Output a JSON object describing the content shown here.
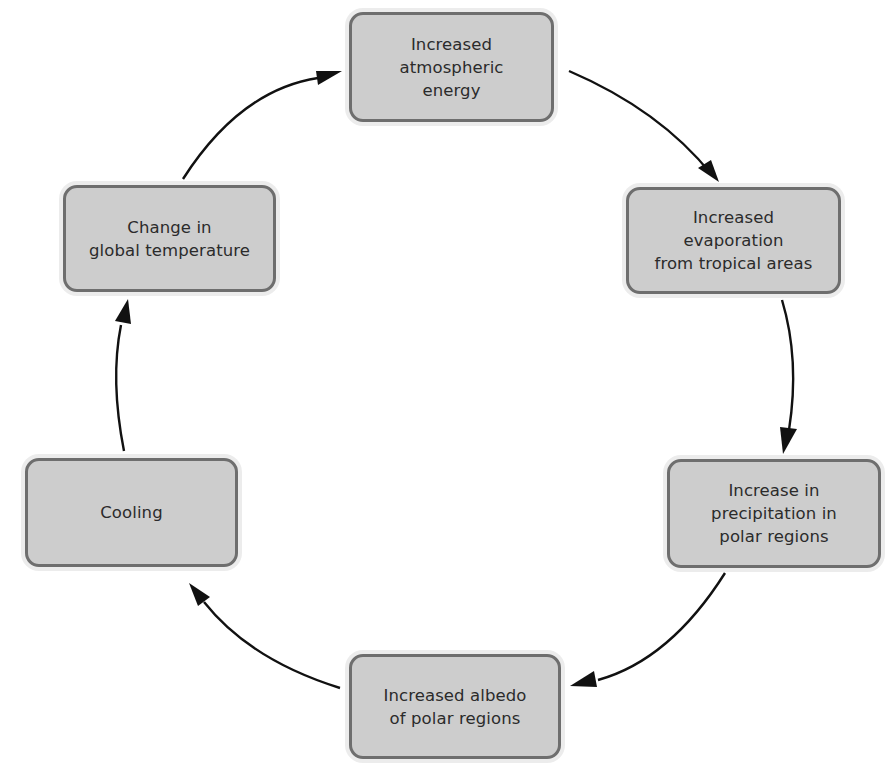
{
  "diagram": {
    "type": "cycle",
    "colors": {
      "box_fill": "#cdcdcd",
      "box_border": "#6e6e6e",
      "text": "#2b2b2b",
      "arrow": "#111111",
      "background": "#ffffff"
    },
    "nodes": [
      {
        "id": "increased-atmospheric-energy",
        "label": "Increased\natmospheric\nenergy"
      },
      {
        "id": "increased-evaporation",
        "label": "Increased\nevaporation\nfrom tropical areas"
      },
      {
        "id": "increase-precipitation",
        "label": "Increase in\nprecipitation in\npolar regions"
      },
      {
        "id": "increased-albedo",
        "label": "Increased albedo\nof polar regions"
      },
      {
        "id": "cooling",
        "label": "Cooling"
      },
      {
        "id": "change-global-temperature",
        "label": "Change in\nglobal temperature"
      }
    ],
    "edges": [
      {
        "from": "increased-atmospheric-energy",
        "to": "increased-evaporation"
      },
      {
        "from": "increased-evaporation",
        "to": "increase-precipitation"
      },
      {
        "from": "increase-precipitation",
        "to": "increased-albedo"
      },
      {
        "from": "increased-albedo",
        "to": "cooling"
      },
      {
        "from": "cooling",
        "to": "change-global-temperature"
      },
      {
        "from": "change-global-temperature",
        "to": "increased-atmospheric-energy"
      }
    ]
  }
}
